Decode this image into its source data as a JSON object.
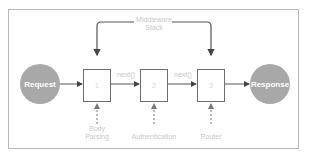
{
  "diagram": {
    "title_line1": "Middleware",
    "title_line2": "Stack",
    "start_node": "Request",
    "end_node": "Response",
    "boxes": [
      {
        "number": "1",
        "label_line1": "Body",
        "label_line2": "Parsing"
      },
      {
        "number": "2",
        "label_line1": "Authentication",
        "label_line2": ""
      },
      {
        "number": "3",
        "label_line1": "Router",
        "label_line2": ""
      }
    ],
    "edge_labels": [
      "next()",
      "next()"
    ],
    "colors": {
      "node_fill": "#a8a8a8",
      "line": "#555555",
      "muted_text": "#c8c8c8",
      "frame": "#b9b9b9"
    }
  }
}
